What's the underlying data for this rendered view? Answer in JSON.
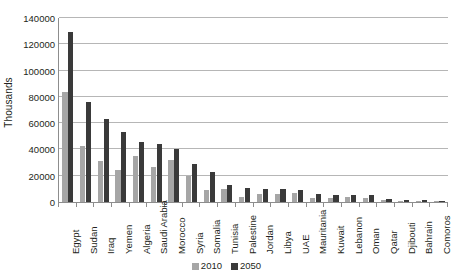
{
  "chart_data": {
    "type": "bar",
    "title": "",
    "subtitle": "",
    "xlabel": "",
    "ylabel": "Thousands",
    "ylim": [
      0,
      140000
    ],
    "ytick_labels": [
      "0",
      "20000",
      "40000",
      "60000",
      "80000",
      "100000",
      "120000",
      "140000"
    ],
    "ytick_values": [
      0,
      20000,
      40000,
      60000,
      80000,
      100000,
      120000,
      140000
    ],
    "grid": true,
    "legend_position": "bottom-center",
    "categories": [
      "Egypt",
      "Sudan",
      "Iraq",
      "Yemen",
      "Algeria",
      "Saudi Arabia",
      "Morocco",
      "Syria",
      "Somalia",
      "Tunisia",
      "Palestine",
      "Jordan",
      "Libya",
      "UAE",
      "Mauritania",
      "Kuwait",
      "Lebanon",
      "Oman",
      "Qatar",
      "Djibouti",
      "Bahrain",
      "Comoros"
    ],
    "series": [
      {
        "name": "2010",
        "color": "#a6a6a6",
        "values": [
          84000,
          43000,
          31000,
          24000,
          35000,
          27000,
          32000,
          20000,
          9000,
          10000,
          4000,
          6000,
          6000,
          7000,
          3000,
          3000,
          4000,
          3000,
          1500,
          900,
          800,
          700
        ]
      },
      {
        "name": "2050",
        "color": "#3a3a3a",
        "values": [
          129000,
          76000,
          63000,
          53000,
          46000,
          44000,
          40000,
          29000,
          23000,
          13000,
          11000,
          10000,
          10000,
          9000,
          6000,
          5000,
          5000,
          5000,
          2500,
          1200,
          1200,
          1000
        ]
      }
    ]
  },
  "legend": {
    "entries": [
      {
        "label": "2010",
        "color": "#a6a6a6"
      },
      {
        "label": "2050",
        "color": "#3a3a3a"
      }
    ]
  },
  "colors": {
    "series_2010": "#a6a6a6",
    "series_2050": "#3a3a3a",
    "gridline": "#b6b6b6",
    "axis": "#8d8d8d",
    "text": "#231f20",
    "background": "#ffffff"
  }
}
